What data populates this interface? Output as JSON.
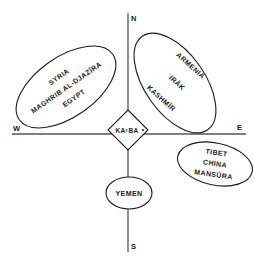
{
  "directions": {
    "north": "N",
    "south": "S",
    "west": "W",
    "east": "E"
  },
  "center": {
    "label": "KAᶜBA",
    "shape": "diamond"
  },
  "regions": {
    "northwest": {
      "lines": [
        "SYRIA",
        "MAGHRIB AL-DJAZĪRA",
        "EGYPT"
      ]
    },
    "northeast": {
      "lines": [
        "ARMENIA",
        "ʿIRĀK",
        "KASHMĪR"
      ]
    },
    "southeast": {
      "lines": [
        "TIBET",
        "CHINA",
        "MANSŪRA"
      ]
    },
    "south": {
      "lines": [
        "YEMEN"
      ]
    }
  },
  "colors": {
    "line": "#1a1a1a",
    "axis": "#555555",
    "background": "#ffffff"
  }
}
